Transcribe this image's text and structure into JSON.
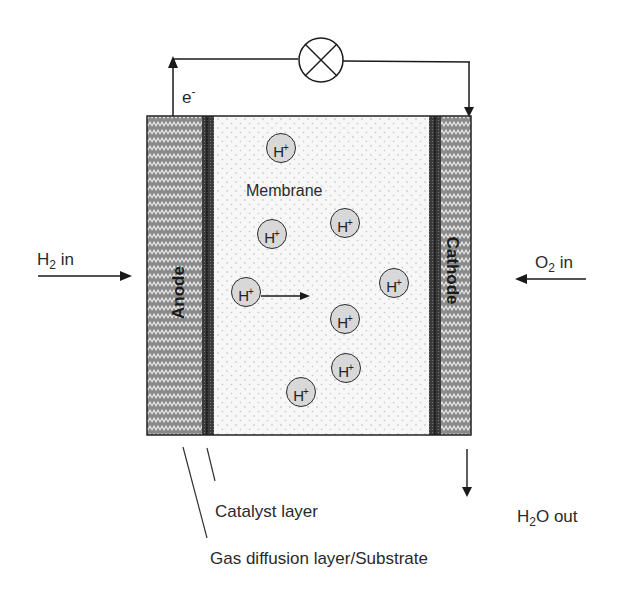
{
  "diagram": {
    "labels": {
      "electron": "e",
      "electron_charge": "-",
      "membrane": "Membrane",
      "anode": "Anode",
      "cathode": "Cathode",
      "h2_in_main": "H",
      "h2_in_sub": "2",
      "h2_in_rest": " in",
      "o2_in_main": "O",
      "o2_in_sub": "2",
      "o2_in_rest": " in",
      "h2o_out_main": "H",
      "h2o_out_sub": "2",
      "h2o_out_rest": "O out",
      "catalyst_layer": "Catalyst layer",
      "gas_diffusion_layer": "Gas diffusion layer/Substrate"
    },
    "ion": {
      "symbol": "H",
      "charge": "+"
    },
    "ions": [
      {
        "x": 266,
        "y": 133
      },
      {
        "x": 257,
        "y": 219
      },
      {
        "x": 330,
        "y": 208
      },
      {
        "x": 231,
        "y": 277
      },
      {
        "x": 379,
        "y": 268
      },
      {
        "x": 330,
        "y": 304
      },
      {
        "x": 331,
        "y": 353
      },
      {
        "x": 286,
        "y": 377
      }
    ],
    "colors": {
      "hatch_bg": "#8a8a8a",
      "hatch_line": "#e8e8e8",
      "catalyst": "#333333",
      "membrane_bg": "#f7f7f7",
      "membrane_dot": "#bdbdbd",
      "ion_fill": "#d8d8d8",
      "line": "#1a1a1a"
    }
  }
}
